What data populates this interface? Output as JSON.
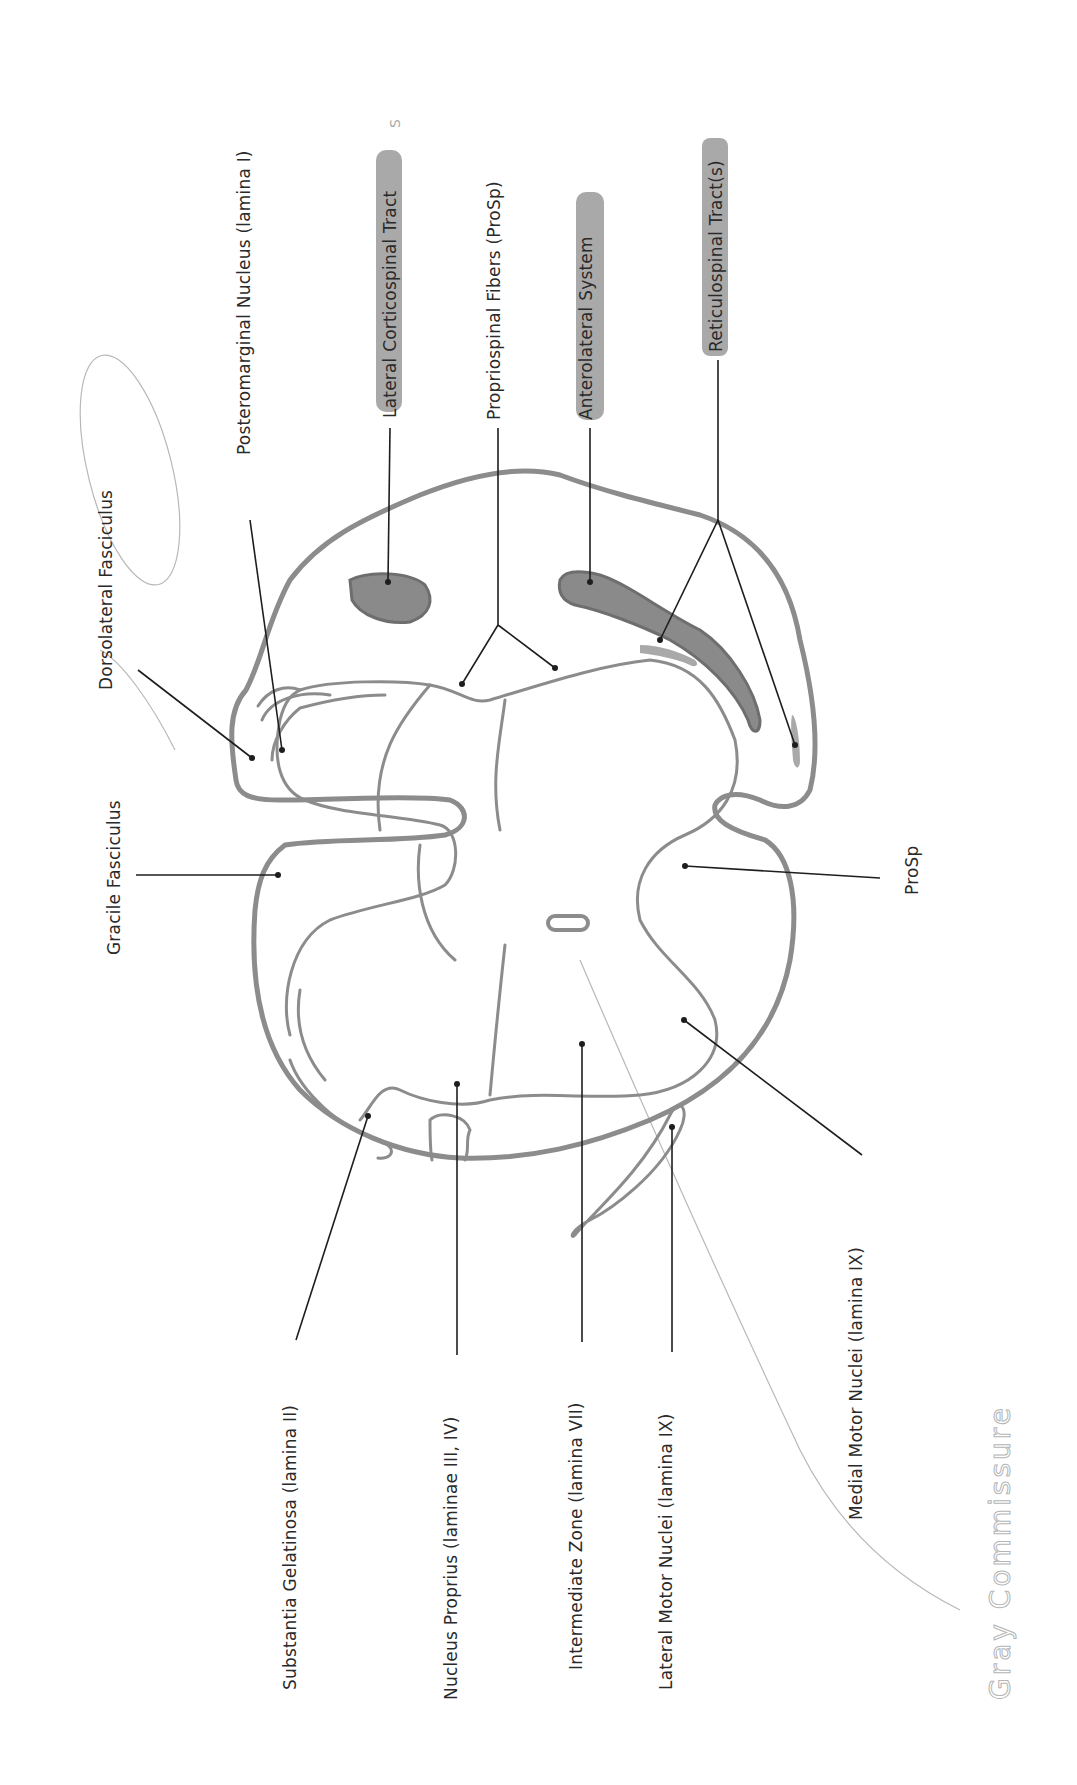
{
  "diagram": {
    "labels": {
      "dorsolateral_fasciculus": "Dorsolateral Fasciculus",
      "posteromarginal_nucleus": "Posteromarginal Nucleus (lamina I)",
      "lateral_corticospinal_tract": "Lateral Corticospinal Tract",
      "propriospinal_fibers": "Propriospinal Fibers (ProSp)",
      "anterolateral_system": "Anterolateral System",
      "reticulospinal_tracts": "Reticulospinal Tract(s)",
      "gracile_fasciculus": "Gracile Fasciculus",
      "prosp": "ProSp",
      "substantia_gelatinosa": "Substantia Gelatinosa (lamina II)",
      "nucleus_proprius": "Nucleus Proprius (laminae III, IV)",
      "intermediate_zone": "Intermediate Zone (lamina VII)",
      "lateral_motor_nuclei": "Lateral Motor Nuclei (lamina IX)",
      "medial_motor_nuclei": "Medial Motor Nuclei (lamina IX)"
    },
    "handwritten": {
      "gray_commissure": "Gray Commissure",
      "margin_mark": "S"
    },
    "highlighted_labels": [
      "Lateral Corticospinal Tract",
      "Anterolateral System",
      "Reticulospinal Tract(s)"
    ],
    "circled_label": "Dorsolateral Fasciculus",
    "colors": {
      "outline": "#8c8c8c",
      "leader": "#1e1e1e",
      "highlight": "#9a9a9a",
      "text": "#2a2a2a",
      "pencil": "#b8b8b8"
    }
  }
}
